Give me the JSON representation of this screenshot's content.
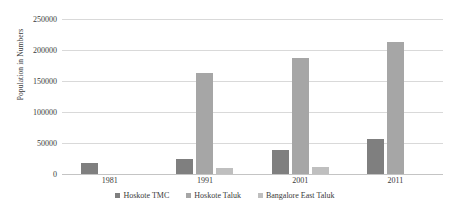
{
  "chart_data": {
    "type": "bar",
    "title": "",
    "subtitle": "",
    "xlabel": "",
    "ylabel": "Population in Numbers",
    "categories": [
      "1981",
      "1991",
      "2001",
      "2011"
    ],
    "series": [
      {
        "name": "Hoskote TMC",
        "color": "#7f7f7f",
        "values": [
          18000,
          25000,
          38000,
          57000
        ]
      },
      {
        "name": "Hoskote Taluk",
        "color": "#a6a6a6",
        "values": [
          null,
          163000,
          187000,
          213000
        ]
      },
      {
        "name": "Bangalore East Taluk",
        "color": "#bfbfbf",
        "values": [
          null,
          10000,
          12000,
          null
        ]
      }
    ],
    "ylim": [
      0,
      250000
    ],
    "yticks": [
      0,
      50000,
      100000,
      150000,
      200000,
      250000
    ],
    "ytick_labels": [
      "0",
      "50000",
      "100000",
      "150000",
      "200000",
      "250000"
    ],
    "grid": true,
    "legend_position": "bottom"
  }
}
